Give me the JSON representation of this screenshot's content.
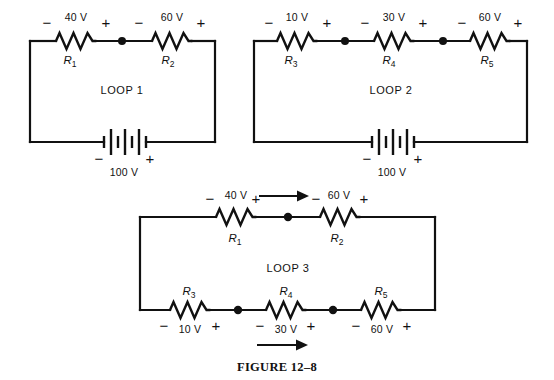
{
  "figure": {
    "caption": "FIGURE 12–8",
    "background_color": "#ffffff",
    "ink_color": "#111111"
  },
  "loops": [
    {
      "id": "loop-1",
      "name": "LOOP 1",
      "source": {
        "label": "100 V",
        "minus": "−",
        "plus": "+",
        "cells": 3
      },
      "components": [
        {
          "ref": "R",
          "sub": "1",
          "drop": "40 V",
          "left_sign": "−",
          "right_sign": "+"
        },
        {
          "ref": "R",
          "sub": "2",
          "drop": "60 V",
          "left_sign": "−",
          "right_sign": "+"
        }
      ],
      "nodes": 1,
      "arrows": []
    },
    {
      "id": "loop-2",
      "name": "LOOP 2",
      "source": {
        "label": "100 V",
        "minus": "−",
        "plus": "+",
        "cells": 3
      },
      "components": [
        {
          "ref": "R",
          "sub": "3",
          "drop": "10 V",
          "left_sign": "−",
          "right_sign": "+"
        },
        {
          "ref": "R",
          "sub": "4",
          "drop": "30 V",
          "left_sign": "−",
          "right_sign": "+"
        },
        {
          "ref": "R",
          "sub": "5",
          "drop": "60 V",
          "left_sign": "−",
          "right_sign": "+"
        }
      ],
      "nodes": 2,
      "arrows": []
    },
    {
      "id": "loop-3",
      "name": "LOOP 3",
      "source": null,
      "components_top": [
        {
          "ref": "R",
          "sub": "1",
          "drop": "40 V",
          "left_sign": "−",
          "right_sign": "+"
        },
        {
          "ref": "R",
          "sub": "2",
          "drop": "60 V",
          "left_sign": "−",
          "right_sign": "+"
        }
      ],
      "components_bottom": [
        {
          "ref": "R",
          "sub": "3",
          "drop": "10 V",
          "left_sign": "−",
          "right_sign": "+"
        },
        {
          "ref": "R",
          "sub": "4",
          "drop": "30 V",
          "left_sign": "−",
          "right_sign": "+"
        },
        {
          "ref": "R",
          "sub": "5",
          "drop": "60 V",
          "left_sign": "−",
          "right_sign": "+"
        }
      ],
      "nodes": 3,
      "arrows": [
        {
          "name": "current-arrow-top",
          "direction": "right"
        },
        {
          "name": "current-arrow-bottom",
          "direction": "right"
        }
      ]
    }
  ],
  "labels": {
    "loop1_name": "LOOP 1",
    "loop2_name": "LOOP 2",
    "loop3_name": "LOOP 3",
    "l1_r1_ref": "R",
    "l1_r1_sub": "1",
    "l1_r1_drop": "40 V",
    "l1_r1_minus": "−",
    "l1_r1_plus": "+",
    "l1_r2_ref": "R",
    "l1_r2_sub": "2",
    "l1_r2_drop": "60 V",
    "l1_r2_minus": "−",
    "l1_r2_plus": "+",
    "l1_src_label": "100 V",
    "l1_src_minus": "−",
    "l1_src_plus": "+",
    "l2_r3_ref": "R",
    "l2_r3_sub": "3",
    "l2_r3_drop": "10 V",
    "l2_r3_minus": "−",
    "l2_r3_plus": "+",
    "l2_r4_ref": "R",
    "l2_r4_sub": "4",
    "l2_r4_drop": "30 V",
    "l2_r4_minus": "−",
    "l2_r4_plus": "+",
    "l2_r5_ref": "R",
    "l2_r5_sub": "5",
    "l2_r5_drop": "60 V",
    "l2_r5_minus": "−",
    "l2_r5_plus": "+",
    "l2_src_label": "100 V",
    "l2_src_minus": "−",
    "l2_src_plus": "+",
    "l3_r1_ref": "R",
    "l3_r1_sub": "1",
    "l3_r1_drop": "40 V",
    "l3_r1_minus": "−",
    "l3_r1_plus": "+",
    "l3_r2_ref": "R",
    "l3_r2_sub": "2",
    "l3_r2_drop": "60 V",
    "l3_r2_minus": "−",
    "l3_r2_plus": "+",
    "l3_r3_ref": "R",
    "l3_r3_sub": "3",
    "l3_r3_drop": "10 V",
    "l3_r3_minus": "−",
    "l3_r3_plus": "+",
    "l3_r4_ref": "R",
    "l3_r4_sub": "4",
    "l3_r4_drop": "30 V",
    "l3_r4_minus": "−",
    "l3_r4_plus": "+",
    "l3_r5_ref": "R",
    "l3_r5_sub": "5",
    "l3_r5_drop": "60 V",
    "l3_r5_minus": "−",
    "l3_r5_plus": "+",
    "caption": "FIGURE 12–8"
  }
}
